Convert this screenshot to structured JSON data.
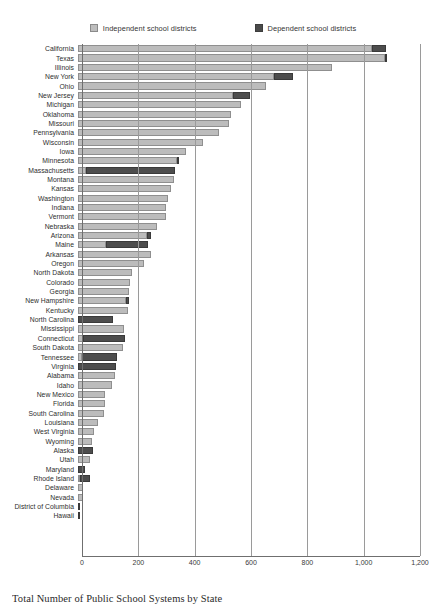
{
  "caption": "Total Number of Public School Systems by State",
  "legend": {
    "position": "top-center",
    "entries": [
      {
        "label": "Independent school districts",
        "icon": "legend-swatch-light",
        "color": "#bcbcbc"
      },
      {
        "label": "Dependent school districts",
        "icon": "legend-swatch-dark",
        "color": "#4d4d4d"
      }
    ]
  },
  "axis": {
    "ticks": [
      "0",
      "200",
      "400",
      "600",
      "800",
      "1,000",
      "1,200"
    ],
    "tick_values": [
      0,
      200,
      400,
      600,
      800,
      1000,
      1200
    ],
    "xlim": [
      0,
      1200
    ],
    "grid": true
  },
  "chart_data": {
    "type": "bar",
    "orientation": "horizontal",
    "stacked": true,
    "title": "Total Number of Public School Systems by State",
    "xlabel": "",
    "ylabel": "",
    "xlim": [
      0,
      1200
    ],
    "grid": true,
    "legend_position": "top-center",
    "categories": [
      "California",
      "Texas",
      "Illinois",
      "New York",
      "Ohio",
      "New Jersey",
      "Michigan",
      "Oklahoma",
      "Missouri",
      "Pennsylvania",
      "Wisconsin",
      "Iowa",
      "Minnesota",
      "Massachusetts",
      "Montana",
      "Kansas",
      "Washington",
      "Indiana",
      "Vermont",
      "Nebraska",
      "Arizona",
      "Maine",
      "Arkansas",
      "Oregon",
      "North Dakota",
      "Colorado",
      "Georgia",
      "New Hampshire",
      "Kentucky",
      "North Carolina",
      "Mississippi",
      "Connecticut",
      "South Dakota",
      "Tennessee",
      "Virginia",
      "Alabama",
      "Idaho",
      "New Mexico",
      "Florida",
      "South Carolina",
      "Louisiana",
      "West Virginia",
      "Wyoming",
      "Alaska",
      "Utah",
      "Maryland",
      "Rhode Island",
      "Delaware",
      "Nevada",
      "District of Columbia",
      "Hawaii"
    ],
    "series": [
      {
        "name": "Independent school districts",
        "color": "#bcbcbc",
        "values": [
          1043,
          1089,
          903,
          697,
          668,
          549,
          580,
          544,
          535,
          500,
          443,
          384,
          350,
          30,
          340,
          330,
          318,
          314,
          311,
          280,
          245,
          100,
          260,
          235,
          192,
          183,
          180,
          170,
          176,
          0,
          164,
          17,
          158,
          14,
          0,
          132,
          120,
          96,
          95,
          92,
          70,
          57,
          48,
          0,
          41,
          0,
          4,
          19,
          17,
          0,
          0
        ]
      },
      {
        "name": "Dependent school districts",
        "color": "#4d4d4d",
        "values": [
          52,
          6,
          0,
          65,
          0,
          62,
          0,
          0,
          0,
          0,
          0,
          0,
          6,
          316,
          0,
          0,
          0,
          0,
          0,
          0,
          14,
          150,
          0,
          0,
          0,
          0,
          0,
          10,
          0,
          125,
          0,
          151,
          0,
          125,
          135,
          0,
          0,
          0,
          0,
          0,
          0,
          0,
          0,
          53,
          0,
          24,
          36,
          0,
          0,
          1,
          1
        ]
      }
    ],
    "totals": [
      1095,
      1095,
      903,
      762,
      668,
      611,
      580,
      544,
      535,
      500,
      443,
      384,
      356,
      346,
      340,
      330,
      318,
      314,
      311,
      280,
      259,
      250,
      260,
      235,
      192,
      183,
      180,
      180,
      176,
      125,
      164,
      168,
      158,
      139,
      135,
      132,
      120,
      96,
      95,
      92,
      70,
      57,
      48,
      53,
      41,
      24,
      40,
      19,
      17,
      1,
      1
    ]
  }
}
